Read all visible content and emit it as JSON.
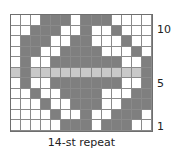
{
  "chart_data": {
    "type": "table",
    "caption": "14-st repeat",
    "columns": 14,
    "rows_count": 11,
    "legend": {
      "D": "dark grey (contrast color)",
      "W": "white (main color)",
      "L": "light grey (highlighted row)"
    },
    "row_labels": [
      {
        "row": 10,
        "label": "10"
      },
      {
        "row": 5,
        "label": "5"
      },
      {
        "row": 1,
        "label": "1"
      }
    ],
    "rows_top_to_bottom": [
      {
        "row": 11,
        "cells": [
          "W",
          "W",
          "W",
          "D",
          "D",
          "D",
          "W",
          "D",
          "D",
          "D",
          "W",
          "W",
          "W",
          "W"
        ]
      },
      {
        "row": 10,
        "cells": [
          "W",
          "W",
          "D",
          "D",
          "D",
          "W",
          "W",
          "D",
          "W",
          "W",
          "D",
          "W",
          "W",
          "W"
        ]
      },
      {
        "row": 9,
        "cells": [
          "W",
          "D",
          "D",
          "D",
          "W",
          "W",
          "D",
          "D",
          "W",
          "W",
          "W",
          "D",
          "W",
          "W"
        ]
      },
      {
        "row": 8,
        "cells": [
          "W",
          "D",
          "D",
          "W",
          "W",
          "D",
          "D",
          "D",
          "D",
          "W",
          "W",
          "W",
          "D",
          "W"
        ]
      },
      {
        "row": 7,
        "cells": [
          "W",
          "D",
          "W",
          "W",
          "D",
          "D",
          "D",
          "D",
          "D",
          "D",
          "D",
          "W",
          "W",
          "D"
        ]
      },
      {
        "row": 6,
        "cells": [
          "L",
          "D",
          "L",
          "L",
          "L",
          "L",
          "L",
          "L",
          "L",
          "L",
          "L",
          "L",
          "L",
          "D"
        ]
      },
      {
        "row": 5,
        "cells": [
          "W",
          "D",
          "W",
          "W",
          "D",
          "D",
          "D",
          "D",
          "D",
          "D",
          "D",
          "W",
          "W",
          "D"
        ]
      },
      {
        "row": 4,
        "cells": [
          "W",
          "W",
          "D",
          "W",
          "W",
          "D",
          "D",
          "D",
          "D",
          "W",
          "W",
          "W",
          "D",
          "D"
        ]
      },
      {
        "row": 3,
        "cells": [
          "W",
          "W",
          "W",
          "D",
          "W",
          "W",
          "D",
          "D",
          "D",
          "W",
          "W",
          "D",
          "D",
          "D"
        ]
      },
      {
        "row": 2,
        "cells": [
          "W",
          "W",
          "W",
          "W",
          "D",
          "W",
          "W",
          "D",
          "W",
          "W",
          "D",
          "D",
          "D",
          "W"
        ]
      },
      {
        "row": 1,
        "cells": [
          "W",
          "W",
          "W",
          "W",
          "W",
          "D",
          "D",
          "D",
          "W",
          "D",
          "D",
          "D",
          "W",
          "W"
        ]
      }
    ],
    "colors": {
      "D": "#7f7f7f",
      "W": "#ffffff",
      "L": "#c9c9c9",
      "grid": "#8a8a8a"
    }
  },
  "labels": {
    "row10": "10",
    "row5": "5",
    "row1": "1",
    "caption": "14-st repeat"
  }
}
